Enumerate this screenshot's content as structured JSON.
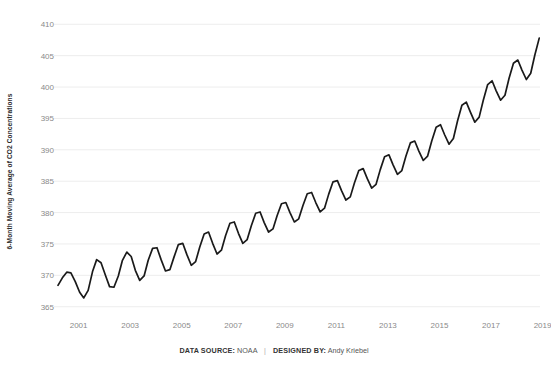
{
  "chart_data": {
    "type": "line",
    "title": "",
    "subtitle": "",
    "xlabel": "",
    "ylabel": "6-Month Moving Average of CO2 Concentrations",
    "ylim": [
      364,
      411
    ],
    "xlim": [
      2000.2,
      2018.9
    ],
    "yticks": [
      365,
      370,
      375,
      380,
      385,
      390,
      395,
      400,
      405,
      410
    ],
    "xticks": [
      2001,
      2003,
      2005,
      2007,
      2009,
      2011,
      2013,
      2015,
      2017,
      2019
    ],
    "grid": "horizontal",
    "legend": "none",
    "line_color": "#1a1a1a",
    "line_width": 1.7,
    "series": [
      {
        "name": "6-Month Moving Average of CO2 Concentrations",
        "x": [
          2000.2,
          2000.37,
          2000.54,
          2000.7,
          2000.87,
          2001.04,
          2001.2,
          2001.37,
          2001.54,
          2001.7,
          2001.87,
          2002.04,
          2002.2,
          2002.37,
          2002.54,
          2002.7,
          2002.87,
          2003.04,
          2003.2,
          2003.37,
          2003.54,
          2003.7,
          2003.87,
          2004.04,
          2004.2,
          2004.37,
          2004.54,
          2004.7,
          2004.87,
          2005.04,
          2005.2,
          2005.37,
          2005.54,
          2005.7,
          2005.87,
          2006.04,
          2006.2,
          2006.37,
          2006.54,
          2006.7,
          2006.87,
          2007.04,
          2007.2,
          2007.37,
          2007.54,
          2007.7,
          2007.87,
          2008.04,
          2008.2,
          2008.37,
          2008.54,
          2008.7,
          2008.87,
          2009.04,
          2009.2,
          2009.37,
          2009.54,
          2009.7,
          2009.87,
          2010.04,
          2010.2,
          2010.37,
          2010.54,
          2010.7,
          2010.87,
          2011.04,
          2011.2,
          2011.37,
          2011.54,
          2011.7,
          2011.87,
          2012.04,
          2012.2,
          2012.37,
          2012.54,
          2012.7,
          2012.87,
          2013.04,
          2013.2,
          2013.37,
          2013.54,
          2013.7,
          2013.87,
          2014.04,
          2014.2,
          2014.37,
          2014.54,
          2014.7,
          2014.87,
          2015.04,
          2015.2,
          2015.37,
          2015.54,
          2015.7,
          2015.87,
          2016.04,
          2016.2,
          2016.37,
          2016.54,
          2016.7,
          2016.87,
          2017.04,
          2017.2,
          2017.37,
          2017.54,
          2017.7,
          2017.87,
          2018.04,
          2018.2,
          2018.37,
          2018.54,
          2018.7,
          2018.87
        ],
        "values": [
          368.4,
          369.6,
          370.5,
          370.4,
          369.0,
          367.3,
          366.4,
          367.6,
          370.6,
          372.5,
          372.0,
          370.0,
          368.2,
          368.1,
          369.9,
          372.4,
          373.7,
          373.0,
          370.8,
          369.2,
          369.9,
          372.4,
          374.3,
          374.4,
          372.5,
          370.7,
          370.9,
          372.9,
          374.9,
          375.1,
          373.3,
          371.6,
          372.2,
          374.5,
          376.6,
          376.9,
          375.1,
          373.4,
          374.0,
          376.3,
          378.3,
          378.5,
          376.7,
          375.1,
          375.7,
          377.9,
          379.9,
          380.1,
          378.4,
          376.9,
          377.4,
          379.5,
          381.4,
          381.6,
          380.0,
          378.5,
          379.0,
          381.1,
          383.0,
          383.2,
          381.6,
          380.1,
          380.7,
          382.9,
          384.9,
          385.1,
          383.5,
          382.0,
          382.5,
          384.7,
          386.7,
          387.0,
          385.4,
          383.9,
          384.5,
          386.8,
          388.9,
          389.2,
          387.6,
          386.1,
          386.7,
          389.0,
          391.1,
          391.4,
          389.8,
          388.3,
          389.0,
          391.4,
          393.6,
          394.0,
          392.4,
          390.9,
          391.8,
          394.6,
          397.1,
          397.6,
          396.0,
          394.4,
          395.2,
          397.9,
          400.4,
          401.0,
          399.4,
          397.9,
          398.7,
          401.4,
          403.8,
          404.3,
          402.7,
          401.2,
          402.2,
          405.1,
          407.8
        ]
      }
    ],
    "annotations": []
  },
  "footer": {
    "source_label": "DATA SOURCE:",
    "source_value": "NOAA",
    "separator": "|",
    "designer_label": "DESIGNED BY:",
    "designer_value": "Andy Kriebel"
  }
}
